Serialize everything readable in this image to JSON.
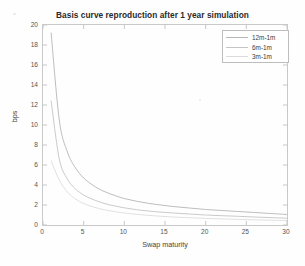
{
  "title": "Basis curve reproduction after 1 year simulation",
  "axes": {
    "xlabel": "Swap maturity",
    "ylabel": "bps",
    "xticks": [
      "0",
      "5",
      "10",
      "15",
      "20",
      "25",
      "30"
    ],
    "yticks": [
      "0",
      "2",
      "4",
      "6",
      "8",
      "10",
      "12",
      "14",
      "16",
      "18",
      "20"
    ]
  },
  "legend": {
    "items": [
      {
        "label": "12m-1m",
        "color": "#b6b6b6"
      },
      {
        "label": "6m-1m",
        "color": "#c4c4c4"
      },
      {
        "label": "3m-1m",
        "color": "#dcdcdc"
      }
    ]
  },
  "chart_data": {
    "type": "line",
    "title": "Basis curve reproduction after 1 year simulation",
    "xlabel": "Swap maturity",
    "ylabel": "bps",
    "xlim": [
      0,
      30
    ],
    "ylim": [
      0,
      20
    ],
    "xticks": [
      0,
      5,
      10,
      15,
      20,
      25,
      30
    ],
    "yticks": [
      0,
      2,
      4,
      6,
      8,
      10,
      12,
      14,
      16,
      18,
      20
    ],
    "grid": false,
    "legend_position": "top-right",
    "x": [
      1,
      2,
      3,
      4,
      5,
      6,
      7,
      8,
      9,
      10,
      12,
      14,
      16,
      18,
      20,
      22,
      24,
      26,
      28,
      30
    ],
    "series": [
      {
        "name": "12m-1m",
        "color": "#b6b6b6",
        "values": [
          19.2,
          10.5,
          7.3,
          5.7,
          4.7,
          4.05,
          3.55,
          3.2,
          2.9,
          2.65,
          2.3,
          2.05,
          1.85,
          1.7,
          1.55,
          1.45,
          1.35,
          1.25,
          1.15,
          1.05
        ]
      },
      {
        "name": "6m-1m",
        "color": "#c4c4c4",
        "values": [
          12.4,
          6.6,
          4.6,
          3.6,
          3.0,
          2.6,
          2.3,
          2.05,
          1.88,
          1.72,
          1.48,
          1.32,
          1.2,
          1.1,
          1.0,
          0.93,
          0.87,
          0.8,
          0.74,
          0.68
        ]
      },
      {
        "name": "3m-1m",
        "color": "#dcdcdc",
        "values": [
          6.4,
          4.5,
          3.3,
          2.6,
          2.15,
          1.85,
          1.62,
          1.45,
          1.32,
          1.2,
          1.03,
          0.9,
          0.8,
          0.73,
          0.66,
          0.61,
          0.56,
          0.52,
          0.48,
          0.44
        ]
      }
    ]
  }
}
